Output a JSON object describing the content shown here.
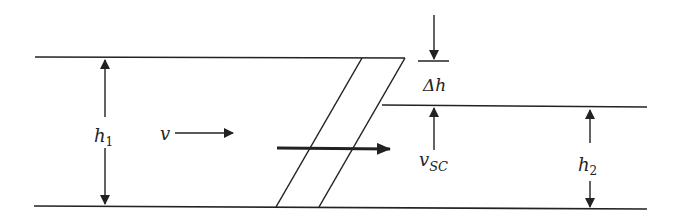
{
  "diagram": {
    "type": "hydraulic-jump / surge channel schematic",
    "labels": {
      "h1": {
        "base": "h",
        "sub": "1"
      },
      "v": {
        "base": "v"
      },
      "delta_h": {
        "text": "Δh"
      },
      "v_sc": {
        "base": "v",
        "sub": "SC"
      },
      "h2": {
        "base": "h",
        "sub": "2"
      }
    },
    "colors": {
      "line": "#222222",
      "background": "#ffffff"
    }
  }
}
